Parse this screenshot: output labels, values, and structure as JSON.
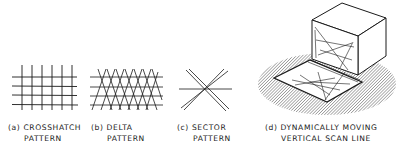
{
  "figure": {
    "panels": [
      {
        "id": "a",
        "label_line1": "(a) CROSSHATCH",
        "label_line2": "PATTERN",
        "pattern": "crosshatch"
      },
      {
        "id": "b",
        "label_line1": "(b) DELTA",
        "label_line2": "PATTERN",
        "pattern": "delta"
      },
      {
        "id": "c",
        "label_line1": "(c) SECTOR",
        "label_line2": "PATTERN",
        "pattern": "sector"
      },
      {
        "id": "d",
        "label_line1": "(d) DYNAMICALLY MOVING",
        "label_line2": "VERTICAL SCAN LINE",
        "pattern": "dynamic-vertical-scan-line"
      }
    ],
    "colors": {
      "line": "#1a1a1a",
      "hatch": "#555555",
      "background": "#ffffff"
    }
  }
}
